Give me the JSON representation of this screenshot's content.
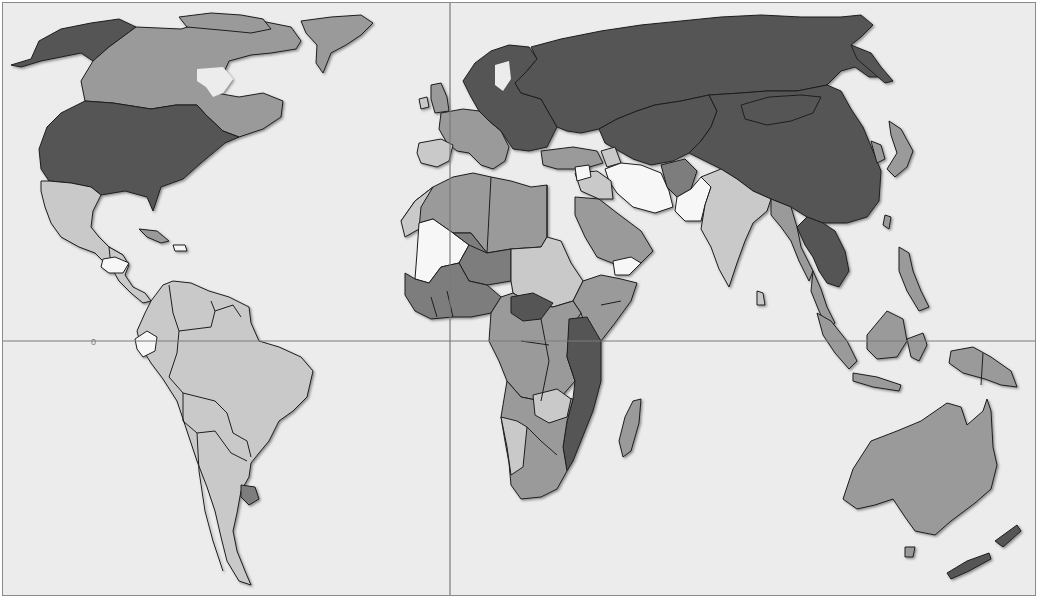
{
  "map": {
    "type": "choropleth-world-map",
    "projection": "cylindrical",
    "background_color": "#ececec",
    "frame_color": "#8a8a8a",
    "gridlines": {
      "equator": {
        "y": 340,
        "label": "0"
      },
      "prime_meridian": {
        "x": 449
      }
    },
    "shade_classes": [
      {
        "id": "c1",
        "name": "lightest",
        "color": "#f7f7f7"
      },
      {
        "id": "c2",
        "name": "light",
        "color": "#c9c9c9"
      },
      {
        "id": "c3",
        "name": "medium",
        "color": "#9a9a9a"
      },
      {
        "id": "c4",
        "name": "medium-dark",
        "color": "#7d7d7d"
      },
      {
        "id": "c5",
        "name": "darkest",
        "color": "#555555"
      }
    ],
    "regions": [
      {
        "name": "Alaska / USA",
        "class": "c5"
      },
      {
        "name": "Canada",
        "class": "c3"
      },
      {
        "name": "Greenland",
        "class": "c3"
      },
      {
        "name": "United States",
        "class": "c5"
      },
      {
        "name": "Mexico",
        "class": "c2"
      },
      {
        "name": "Central America",
        "class": "c2"
      },
      {
        "name": "Honduras / Nicaragua",
        "class": "c1"
      },
      {
        "name": "Cuba",
        "class": "c3"
      },
      {
        "name": "South America",
        "class": "c2"
      },
      {
        "name": "Ecuador",
        "class": "c1"
      },
      {
        "name": "Uruguay",
        "class": "c4"
      },
      {
        "name": "Scandinavia & Eastern Europe",
        "class": "c5"
      },
      {
        "name": "Western Europe",
        "class": "c3"
      },
      {
        "name": "Iberia",
        "class": "c2"
      },
      {
        "name": "Russia",
        "class": "c5"
      },
      {
        "name": "Central Asia",
        "class": "c5"
      },
      {
        "name": "China & Mongolia",
        "class": "c5"
      },
      {
        "name": "Turkey",
        "class": "c3"
      },
      {
        "name": "Iran",
        "class": "c1"
      },
      {
        "name": "Pakistan",
        "class": "c1"
      },
      {
        "name": "Afghanistan",
        "class": "c4"
      },
      {
        "name": "India",
        "class": "c2"
      },
      {
        "name": "Southeast Asia",
        "class": "c5"
      },
      {
        "name": "Myanmar",
        "class": "c3"
      },
      {
        "name": "Indonesia & Philippines",
        "class": "c3"
      },
      {
        "name": "Japan",
        "class": "c3"
      },
      {
        "name": "North Africa",
        "class": "c3"
      },
      {
        "name": "Mali",
        "class": "c1"
      },
      {
        "name": "Niger / Chad",
        "class": "c4"
      },
      {
        "name": "Sudan",
        "class": "c2"
      },
      {
        "name": "Arabian Peninsula",
        "class": "c3"
      },
      {
        "name": "Yemen",
        "class": "c1"
      },
      {
        "name": "West Africa",
        "class": "c4"
      },
      {
        "name": "Central Africa",
        "class": "c3"
      },
      {
        "name": "East Africa",
        "class": "c5"
      },
      {
        "name": "Southern Africa",
        "class": "c3"
      },
      {
        "name": "Namibia",
        "class": "c2"
      },
      {
        "name": "Madagascar",
        "class": "c3"
      },
      {
        "name": "Australia",
        "class": "c3"
      },
      {
        "name": "New Zealand",
        "class": "c5"
      }
    ]
  }
}
